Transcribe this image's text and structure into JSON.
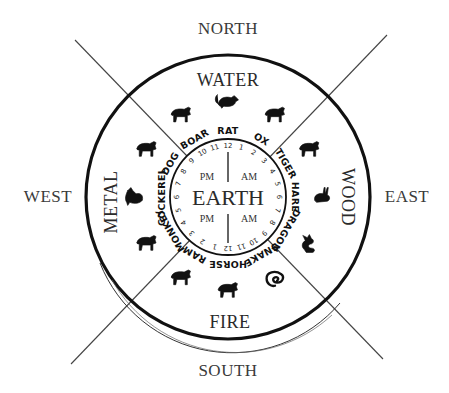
{
  "diagram": {
    "compass": {
      "north": "NORTH",
      "south": "SOUTH",
      "east": "EAST",
      "west": "WEST"
    },
    "elements": {
      "top": "WATER",
      "right": "WOOD",
      "bottom": "FIRE",
      "left": "METAL",
      "center": "EARTH"
    },
    "center_labels": {
      "upper_left": "PM",
      "upper_right": "AM",
      "lower_left": "PM",
      "lower_right": "AM"
    },
    "animals": [
      {
        "name": "RAT",
        "icon": "rat-icon"
      },
      {
        "name": "OX",
        "icon": "ox-icon"
      },
      {
        "name": "TIGER",
        "icon": "tiger-icon"
      },
      {
        "name": "HARE",
        "icon": "hare-icon"
      },
      {
        "name": "DRAGON",
        "icon": "dragon-icon"
      },
      {
        "name": "SNAKE",
        "icon": "snake-icon"
      },
      {
        "name": "HORSE",
        "icon": "horse-icon"
      },
      {
        "name": "RAM",
        "icon": "ram-icon"
      },
      {
        "name": "MONKEY",
        "icon": "monkey-icon"
      },
      {
        "name": "COCKEREL",
        "icon": "cockerel-icon"
      },
      {
        "name": "DOG",
        "icon": "dog-icon"
      },
      {
        "name": "BOAR",
        "icon": "boar-icon"
      }
    ],
    "hours": [
      "12",
      "1",
      "2",
      "3",
      "4",
      "5",
      "6",
      "7",
      "8",
      "9",
      "10",
      "11",
      "12",
      "1",
      "2",
      "3",
      "4",
      "5",
      "6",
      "7",
      "8",
      "9",
      "10",
      "11"
    ],
    "colors": {
      "ink": "#111111",
      "text": "#333333",
      "background": "#ffffff"
    }
  }
}
